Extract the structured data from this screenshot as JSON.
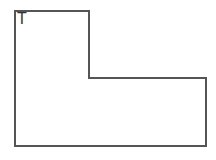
{
  "diagram": {
    "shape": {
      "type": "L-shape",
      "label": "T",
      "stroke_color": "#555555",
      "fill_color": "#ffffff",
      "stroke_width": 2,
      "points": "15,11 89,11 89,78 206,78 206,146 15,146"
    }
  }
}
